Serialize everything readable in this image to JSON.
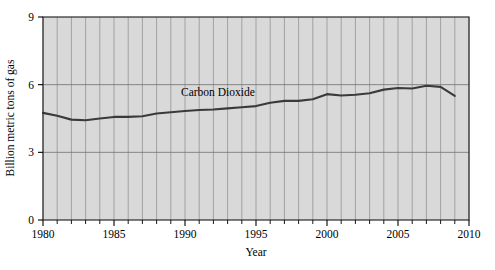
{
  "chart_data": {
    "type": "line",
    "title": "",
    "xlabel": "Year",
    "ylabel": "Billion metric tons of gas",
    "xlim": [
      1980,
      2010
    ],
    "ylim": [
      0,
      9
    ],
    "xticks": [
      1980,
      1985,
      1990,
      1995,
      2000,
      2005,
      2010
    ],
    "xtick_labels": [
      "1980",
      "1985",
      "1990",
      "1995",
      "2000",
      "2005",
      "2010"
    ],
    "xminor_step": 1,
    "yticks": [
      0,
      3,
      6,
      9
    ],
    "ytick_labels": [
      "0",
      "3",
      "6",
      "9"
    ],
    "grid": "vertical-minor-and-horizontal-major",
    "legend_position": "inline-annotation",
    "plot_background": "#d9d9d9",
    "line_color": "#3a3a3a",
    "series": [
      {
        "name": "Carbon Dioxide",
        "annotation": "Carbon Dioxide",
        "x": [
          1980,
          1981,
          1982,
          1983,
          1984,
          1985,
          1986,
          1987,
          1988,
          1989,
          1990,
          1991,
          1992,
          1993,
          1994,
          1995,
          1996,
          1997,
          1998,
          1999,
          2000,
          2001,
          2002,
          2003,
          2004,
          2005,
          2006,
          2007,
          2008,
          2009
        ],
        "values": [
          4.75,
          4.62,
          4.45,
          4.42,
          4.5,
          4.57,
          4.57,
          4.6,
          4.72,
          4.78,
          4.83,
          4.88,
          4.9,
          4.95,
          5.0,
          5.05,
          5.2,
          5.28,
          5.28,
          5.35,
          5.58,
          5.52,
          5.55,
          5.62,
          5.78,
          5.85,
          5.83,
          5.95,
          5.9,
          5.5
        ]
      }
    ]
  },
  "annotations": {
    "series_label": "Carbon Dioxide"
  }
}
